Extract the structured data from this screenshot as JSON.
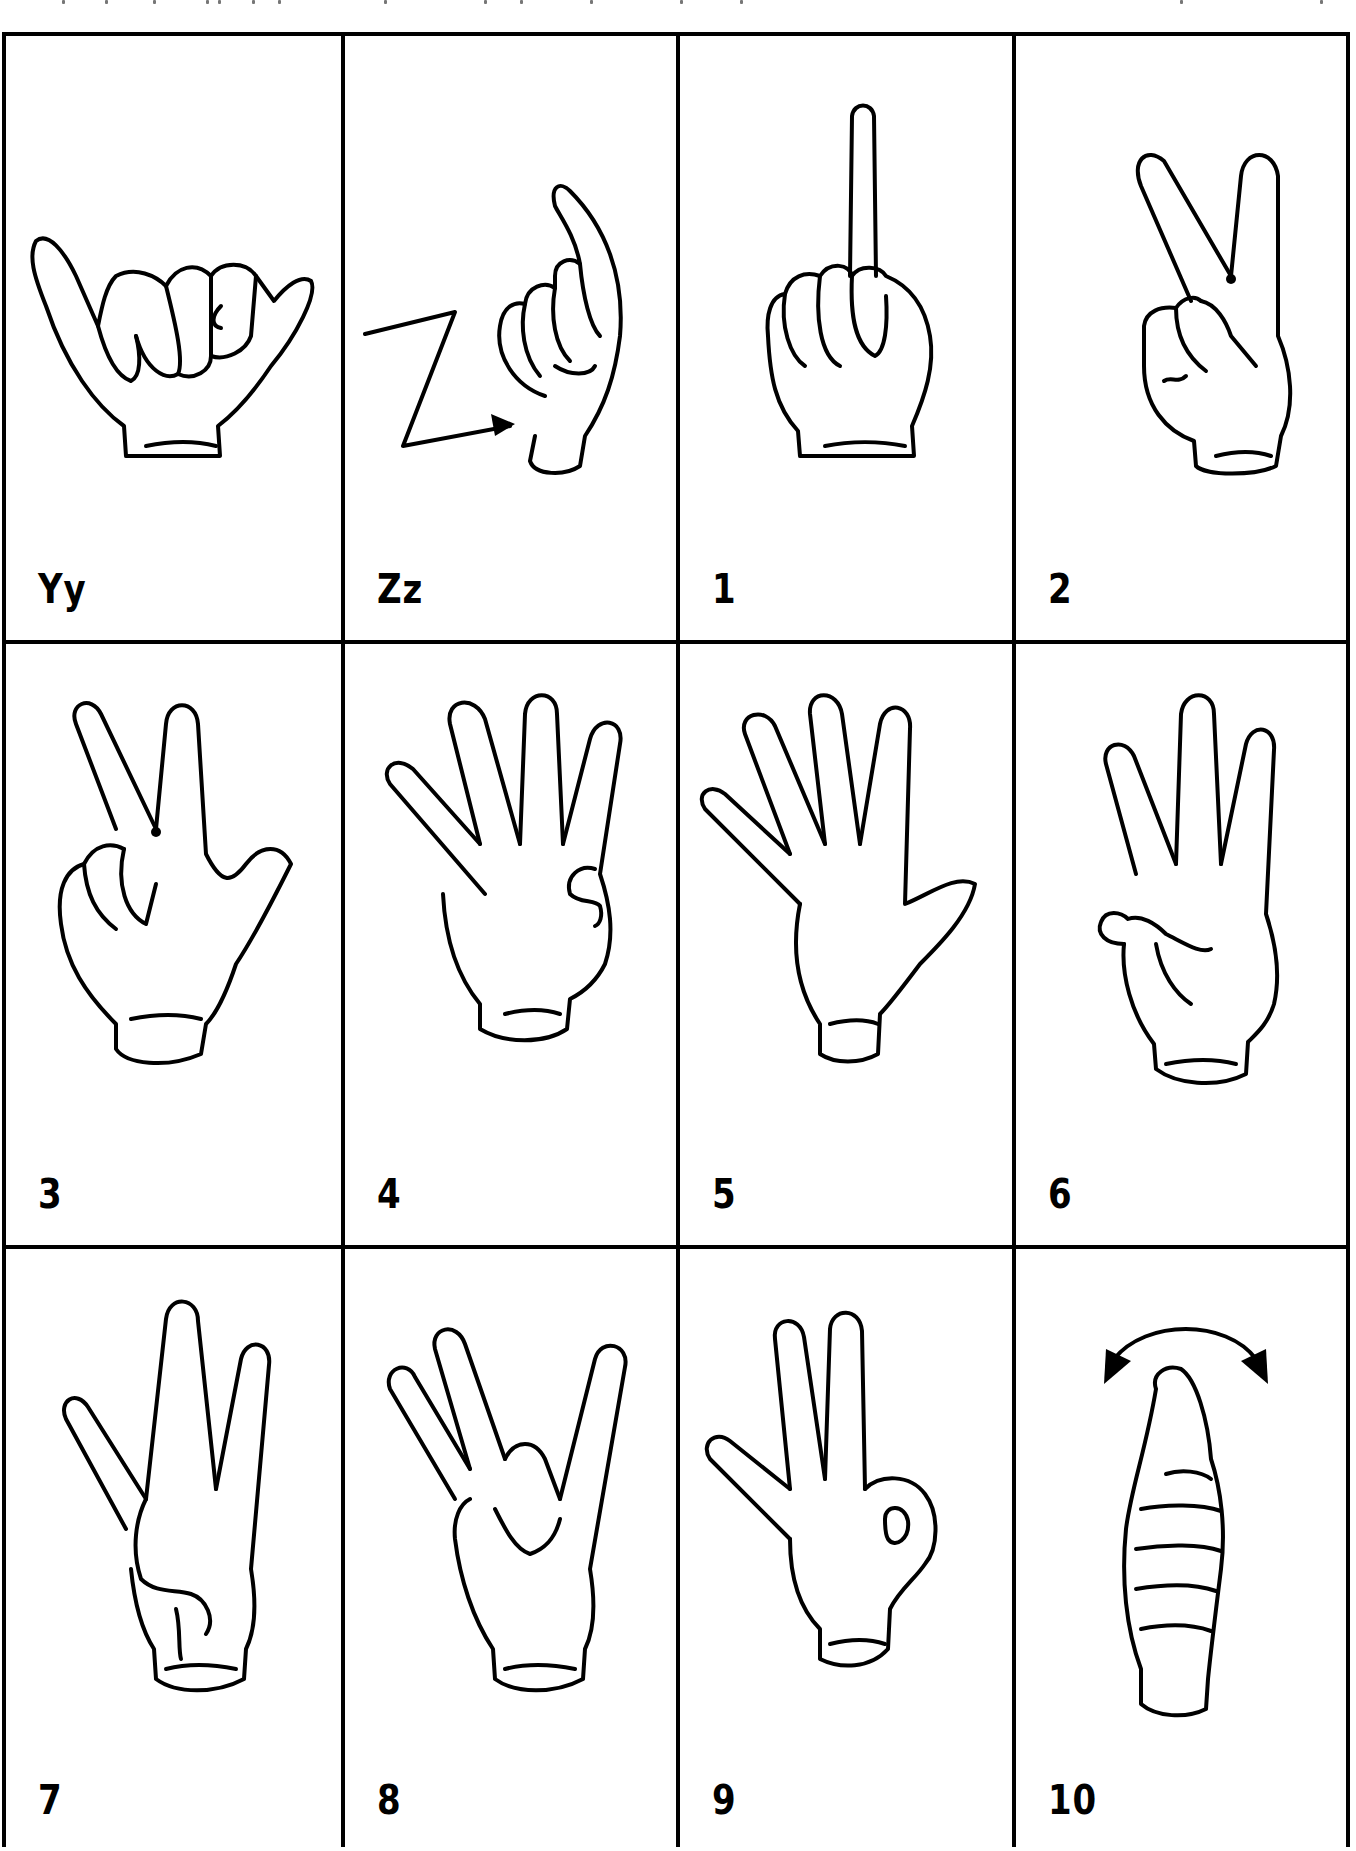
{
  "document": {
    "title": "Sign language alphabet and numbers chart",
    "cells": [
      {
        "label": "Yy",
        "sign": "Y"
      },
      {
        "label": "Zz",
        "sign": "Z"
      },
      {
        "label": "1",
        "sign": "one"
      },
      {
        "label": "2",
        "sign": "two"
      },
      {
        "label": "3",
        "sign": "three"
      },
      {
        "label": "4",
        "sign": "four"
      },
      {
        "label": "5",
        "sign": "five"
      },
      {
        "label": "6",
        "sign": "six"
      },
      {
        "label": "7",
        "sign": "seven"
      },
      {
        "label": "8",
        "sign": "eight"
      },
      {
        "label": "9",
        "sign": "nine"
      },
      {
        "label": "10",
        "sign": "ten"
      }
    ]
  }
}
